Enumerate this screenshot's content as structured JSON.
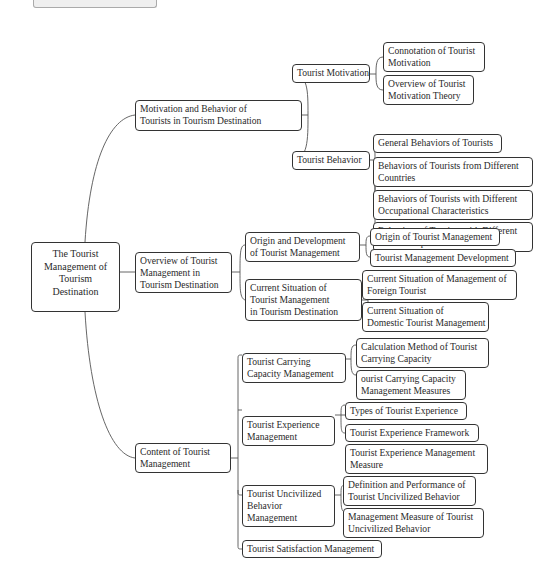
{
  "diagram": {
    "type": "mind-map",
    "root": {
      "label": "The Tourist Management of Tourism Destination",
      "lines": [
        "The Tourist",
        "Management of",
        "Tourism",
        "Destination"
      ]
    },
    "branches": [
      {
        "label": "Motivation and Behavior of Tourists in Tourism Destination",
        "lines": [
          "Motivation and Behavior of",
          "Tourists in Tourism Destination"
        ],
        "children": [
          {
            "label": "Tourist Motivation",
            "lines": [
              "Tourist Motivation"
            ],
            "children": [
              {
                "lines": [
                  "Connotation of Tourist",
                  "Motivation"
                ]
              },
              {
                "lines": [
                  "Overview of Tourist",
                  "Motivation Theory"
                ]
              }
            ]
          },
          {
            "label": "Tourist Behavior",
            "lines": [
              "Tourist Behavior"
            ],
            "children": [
              {
                "lines": [
                  "General Behaviors of Tourists"
                ]
              },
              {
                "lines": [
                  "Behaviors of Tourists from Different",
                  "Countries"
                ]
              },
              {
                "lines": [
                  "Behaviors of Tourists with Different",
                  "Occupational Characteristics"
                ]
              },
              {
                "lines": [
                  "Behaviors of Tourists with Different",
                  "Tourist Purposes"
                ]
              }
            ]
          }
        ]
      },
      {
        "label": "Overview of Tourist Management in Tourism Destination",
        "lines": [
          "Overview of Tourist",
          "Management in",
          "Tourism Destination"
        ],
        "children": [
          {
            "lines": [
              "Origin and Development",
              "of Tourist Management"
            ],
            "children": [
              {
                "lines": [
                  "Origin of Tourist Management"
                ]
              },
              {
                "lines": [
                  "Tourist Management Development"
                ]
              }
            ]
          },
          {
            "lines": [
              "Current Situation of",
              "Tourist Management",
              "in Tourism Destination"
            ],
            "children": [
              {
                "lines": [
                  "Current Situation of Management of",
                  "Foreign Tourist"
                ]
              },
              {
                "lines": [
                  "Current Situation of",
                  "Domestic Tourist Management"
                ]
              }
            ]
          }
        ]
      },
      {
        "label": "Content of Tourist Management",
        "lines": [
          "Content of Tourist",
          "Management"
        ],
        "children": [
          {
            "lines": [
              "Tourist Carrying",
              "Capacity Management"
            ],
            "children": [
              {
                "lines": [
                  "Calculation Method of Tourist",
                  "Carrying Capacity"
                ]
              },
              {
                "lines": [
                  "ourist Carrying Capacity",
                  "Management Measures"
                ]
              }
            ]
          },
          {
            "lines": [
              "Tourist Experience",
              "Management"
            ],
            "children": [
              {
                "lines": [
                  "Types of Tourist Experience"
                ]
              },
              {
                "lines": [
                  "Tourist Experience Framework"
                ]
              },
              {
                "lines": [
                  "Tourist Experience Management",
                  "Measure"
                ]
              }
            ]
          },
          {
            "lines": [
              "Tourist Uncivilized",
              "Behavior",
              "Management"
            ],
            "children": [
              {
                "lines": [
                  "Definition and Performance of",
                  "Tourist Uncivilized Behavior"
                ]
              },
              {
                "lines": [
                  "Management Measure of Tourist",
                  "Uncivilized Behavior"
                ]
              }
            ]
          },
          {
            "lines": [
              "Tourist Satisfaction Management"
            ],
            "children": []
          }
        ]
      }
    ]
  }
}
